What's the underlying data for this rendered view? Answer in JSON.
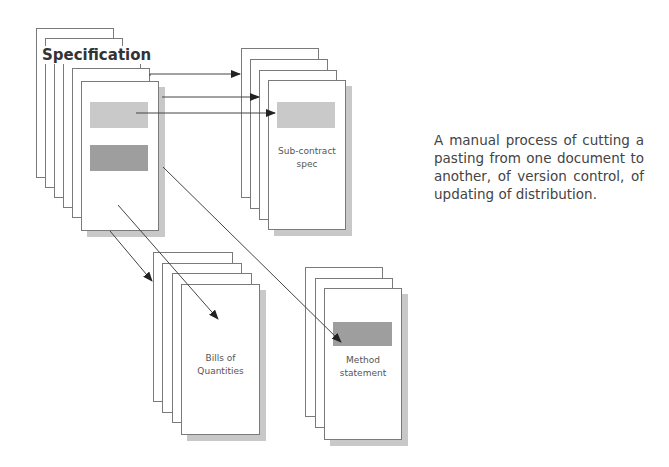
{
  "diagram": {
    "specification": {
      "title": "Specification",
      "page_count": 6
    },
    "documents": [
      {
        "id": "subcontract",
        "label": "Sub-contract spec",
        "lines": [
          "Sub-contract",
          "spec"
        ],
        "page_count": 4
      },
      {
        "id": "bills",
        "label": "Bills of Quantities",
        "lines": [
          "Bills of",
          "Quantities"
        ],
        "page_count": 4
      },
      {
        "id": "method",
        "label": "Method statement",
        "lines": [
          "Method",
          "statement"
        ],
        "page_count": 3
      }
    ],
    "description": "A manual process of cutting a pasting from one document to another, of version control, of updating of distribution.",
    "colors": {
      "border": "#7a7a7a",
      "shadow": "#c8c8c8",
      "block_light": "#c9c9c9",
      "block_dark": "#9e9e9e",
      "text": "#444444"
    }
  }
}
